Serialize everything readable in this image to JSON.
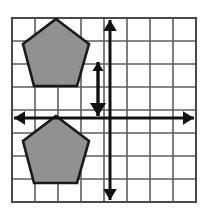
{
  "figure": {
    "background_color": "#ffffff",
    "width": 214,
    "height": 214
  },
  "grid": {
    "name": "coordinate-grid",
    "columns": 8,
    "rows": 8,
    "cell_size": 23,
    "left": 12,
    "top": 18,
    "right": 196,
    "bottom": 202,
    "line_color": "#5e5e5e",
    "line_width": 1.6,
    "border_color": "#4a4a4a",
    "border_width": 2
  },
  "axes": {
    "name": "coordinate-axes",
    "color": "#111111",
    "line_width": 3,
    "origin_x": 110,
    "origin_y": 118,
    "x_axis": {
      "label": "x-axis",
      "x1": 14,
      "x2": 194,
      "y": 118,
      "arrow_left": true,
      "arrow_right": true
    },
    "y_axis": {
      "label": "y-axis",
      "y1": 20,
      "y2": 200,
      "x": 110,
      "arrow_up": true,
      "arrow_down": true
    }
  },
  "translation_vector": {
    "name": "translation-arrow",
    "description": "Double-headed vertical arrow showing the translation distance",
    "x": 98,
    "y_top": 62,
    "y_bottom": 116,
    "color": "#111111",
    "line_width": 3.4,
    "arrow_top": true,
    "arrow_bottom": true
  },
  "shapes": [
    {
      "name": "pentagon-preimage",
      "label": "Top pentagon",
      "fill": "#919191",
      "stroke": "#1a1a1a",
      "stroke_width": 2.6,
      "points": "56,19 89,44 77,86 34,86 23,44"
    },
    {
      "name": "pentagon-image",
      "label": "Bottom pentagon",
      "fill": "#919191",
      "stroke": "#1a1a1a",
      "stroke_width": 2.6,
      "points": "56,116 89,141 77,183 34,183 23,141"
    }
  ]
}
